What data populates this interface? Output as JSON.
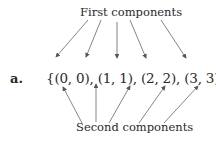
{
  "figure": {
    "item_label": "a.",
    "set_expression": "{(0, 0), (1, 1), (2, 2), (3, 3), (4, 4)}",
    "top_label": "First components",
    "bottom_label": "Second components",
    "pairs": [
      [
        0,
        0
      ],
      [
        1,
        1
      ],
      [
        2,
        2
      ],
      [
        3,
        3
      ],
      [
        4,
        4
      ]
    ]
  }
}
